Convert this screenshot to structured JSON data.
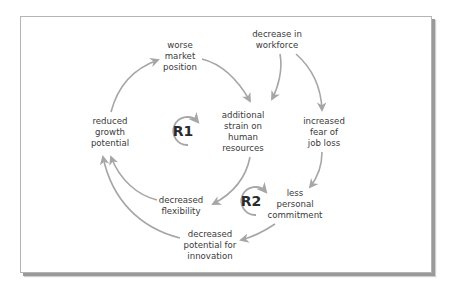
{
  "diagram": {
    "type": "causal-loop",
    "colors": {
      "arrow": "#a6a6a6",
      "text": "#3a3a3a",
      "frame": "#b4b4b4"
    },
    "nodes": [
      {
        "id": "worse-market-position",
        "lines": [
          "worse",
          "market",
          "position"
        ]
      },
      {
        "id": "decrease-in-workforce",
        "lines": [
          "decrease in",
          "workforce"
        ]
      },
      {
        "id": "reduced-growth-potential",
        "lines": [
          "reduced",
          "growth",
          "potential"
        ]
      },
      {
        "id": "additional-strain",
        "lines": [
          "additional",
          "strain on",
          "human",
          "resources"
        ]
      },
      {
        "id": "increased-fear",
        "lines": [
          "increased",
          "fear of",
          "job loss"
        ]
      },
      {
        "id": "less-commitment",
        "lines": [
          "less",
          "personal",
          "commitment"
        ]
      },
      {
        "id": "decreased-flexibility",
        "lines": [
          "decreased",
          "flexibility"
        ]
      },
      {
        "id": "decreased-innovation",
        "lines": [
          "decreased",
          "potential for",
          "innovation"
        ]
      }
    ],
    "loops": [
      {
        "id": "r1",
        "label": "R1",
        "type": "reinforcing"
      },
      {
        "id": "r2",
        "label": "R2",
        "type": "reinforcing"
      }
    ],
    "links": [
      {
        "from": "reduced-growth-potential",
        "to": "worse-market-position"
      },
      {
        "from": "worse-market-position",
        "to": "additional-strain"
      },
      {
        "from": "decrease-in-workforce",
        "to": "additional-strain"
      },
      {
        "from": "decrease-in-workforce",
        "to": "increased-fear"
      },
      {
        "from": "additional-strain",
        "to": "decreased-flexibility"
      },
      {
        "from": "decreased-flexibility",
        "to": "reduced-growth-potential"
      },
      {
        "from": "increased-fear",
        "to": "less-commitment"
      },
      {
        "from": "less-commitment",
        "to": "decreased-innovation"
      },
      {
        "from": "decreased-innovation",
        "to": "reduced-growth-potential"
      }
    ]
  }
}
